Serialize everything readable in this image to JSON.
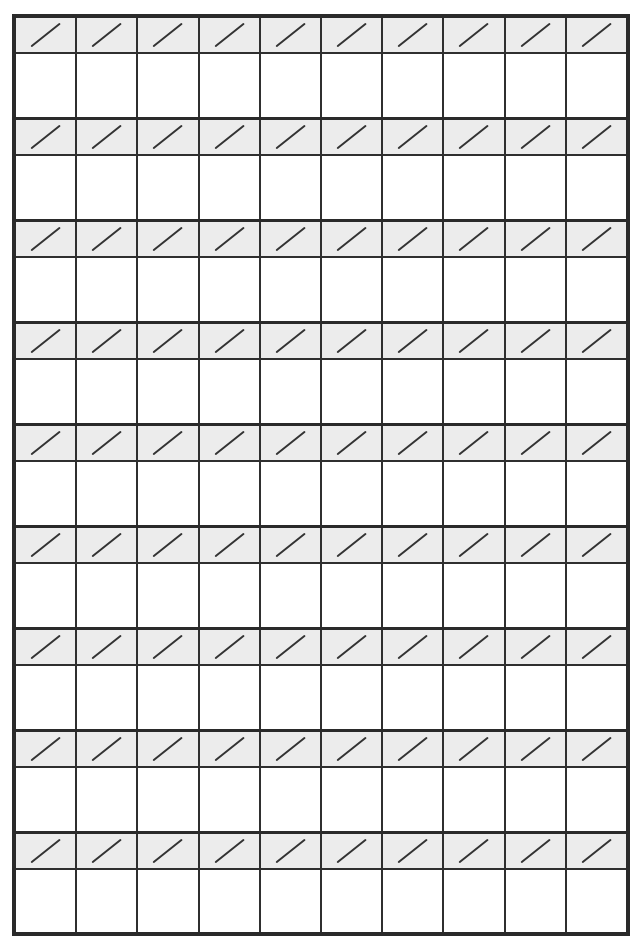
{
  "worksheet": {
    "type": "fraction-practice-grid",
    "columns": 10,
    "rows": 9,
    "cell_top_symbol": "slash-icon",
    "colors": {
      "border": "#2a2a2a",
      "slash_row_bg": "#ececec",
      "answer_row_bg": "#ffffff",
      "slash_stroke": "#333333"
    }
  }
}
